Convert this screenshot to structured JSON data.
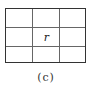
{
  "diagram": {
    "rows": 3,
    "cols": 3,
    "center_cell_label": "r",
    "caption": "(c)"
  }
}
